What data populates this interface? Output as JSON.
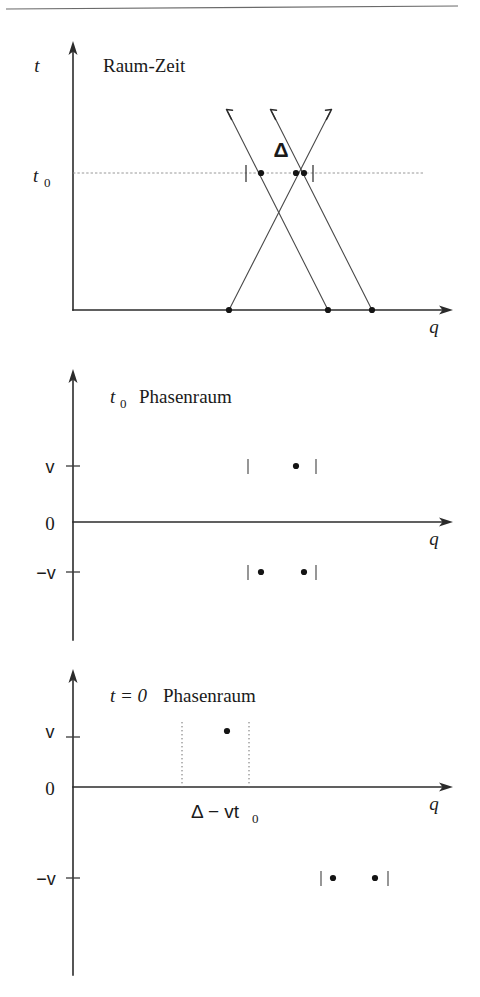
{
  "figure": {
    "kind": "physics-diagram",
    "caption_rule_present": true,
    "background_color": "#ffffff",
    "ink_color": "#1a1a1a"
  },
  "panels": [
    {
      "id": "spacetime",
      "title_math": "",
      "title": "Raum-Zeit",
      "y_axis_label": "t",
      "x_axis_label": "q",
      "level_label": "t",
      "level_label_sub": "0",
      "separation_label": "Δ",
      "axis": {
        "x0": 73,
        "y_base": 310,
        "y_top": 43,
        "x_right": 452
      },
      "level_y": 173,
      "level_line": {
        "x_start": 73,
        "x_end": 424
      },
      "ticks_on_level": [
        246,
        313
      ],
      "dots_on_level": [
        261,
        296,
        304
      ],
      "dots_on_base": [
        229,
        328,
        372
      ],
      "trajectories": [
        {
          "name": "right-mover-a",
          "x_base": 229,
          "x_level": 296,
          "x_top": 330,
          "direction": "up-right"
        },
        {
          "name": "left-mover-a",
          "x_base": 328,
          "x_level": 261,
          "x_top": 228,
          "direction": "up-left"
        },
        {
          "name": "left-mover-b",
          "x_base": 372,
          "x_level": 304,
          "x_top": 272,
          "direction": "up-left"
        }
      ],
      "arrow_top_y": 108
    },
    {
      "id": "phasespace-t0",
      "title_math": "t",
      "title_math_sub": "0",
      "title": "Phasenraum",
      "y_axis_label": "",
      "x_axis_label": "q",
      "axis": {
        "x0": 73,
        "y_top": 370,
        "y_bottom": 640,
        "x_right": 452,
        "y_zero": 522
      },
      "y_ticks": [
        {
          "label": "v",
          "y": 466
        },
        {
          "label": "0",
          "y": 522
        },
        {
          "label": "−v",
          "y": 572
        }
      ],
      "rows": [
        {
          "level": "v",
          "y": 466,
          "brackets": [
            248,
            316
          ],
          "dots": [
            296
          ]
        },
        {
          "level": "-v",
          "y": 572,
          "brackets": [
            248,
            316
          ],
          "dots": [
            261,
            304
          ]
        }
      ]
    },
    {
      "id": "phasespace-t0-zero",
      "title_math": "t = 0",
      "title": "Phasenraum",
      "y_axis_label": "",
      "x_axis_label": "q",
      "annotation": "Δ − vt",
      "annotation_sub": "0",
      "annotation_x": 215,
      "annotation_y": 812,
      "axis": {
        "x0": 73,
        "y_top": 670,
        "y_bottom": 975,
        "x_right": 452,
        "y_zero": 787
      },
      "y_ticks": [
        {
          "label": "v",
          "y": 731
        },
        {
          "label": "0",
          "y": 787
        },
        {
          "label": "−v",
          "y": 878
        }
      ],
      "guides": [
        {
          "x": 182,
          "y_top": 722,
          "y_bottom": 787
        },
        {
          "x": 249,
          "y_top": 722,
          "y_bottom": 787
        }
      ],
      "rows": [
        {
          "level": "v",
          "y": 731,
          "brackets": [],
          "dots": [
            227
          ]
        },
        {
          "level": "-v",
          "y": 878,
          "brackets": [
            321,
            388
          ],
          "dots": [
            333,
            375
          ]
        }
      ]
    }
  ],
  "top_rule": {
    "x1": 6,
    "y1": 9,
    "x2": 458,
    "y2": 6
  }
}
